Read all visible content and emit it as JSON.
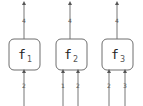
{
  "diagram": {
    "nodes": [
      {
        "id": "f1",
        "name": "f",
        "subscript": "1",
        "output_label": "4",
        "input_labels": [
          "2"
        ]
      },
      {
        "id": "f2",
        "name": "f",
        "subscript": "2",
        "output_label": "4",
        "input_labels": [
          "1",
          "2"
        ]
      },
      {
        "id": "f3",
        "name": "f",
        "subscript": "3",
        "output_label": "4",
        "input_labels": [
          "2",
          "3"
        ]
      }
    ],
    "colors": {
      "stroke": "#6e6e6e",
      "text": "#222222",
      "label": "#555555"
    }
  }
}
